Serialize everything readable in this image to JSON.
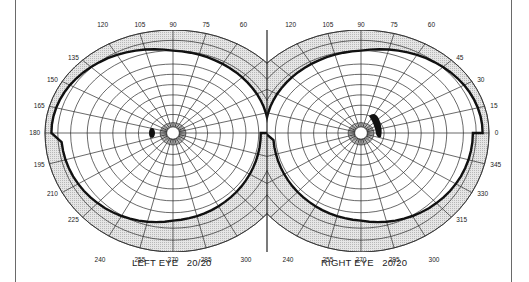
{
  "chart_data": {
    "type": "polar-visual-field",
    "title": "",
    "grid": true,
    "colors": {
      "background": "#ffffff",
      "grid": "#2a2a2a",
      "shade": "#d8d8d8",
      "isopter": "#111111",
      "frame": "#6a6a6a"
    },
    "charts": [
      {
        "id": "left",
        "label": "LEFT EYE",
        "acuity": "20/20",
        "center": [
          173,
          133
        ],
        "angle_labels_shown": [
          "120",
          "105",
          "90",
          "75",
          "60",
          "135",
          "150",
          "165",
          "180",
          "195",
          "210",
          "225",
          "240",
          "255",
          "270",
          "285",
          "300"
        ],
        "blind_spot": {
          "side": "temporal",
          "angle_deg": 180,
          "approx_eccentricity_deg": 15
        },
        "isopter": "thick boundary line; visual field extends wider temporally (left) than nasally"
      },
      {
        "id": "right",
        "label": "RIGHT EYE",
        "acuity": "20/20",
        "center": [
          361,
          133
        ],
        "angle_labels_shown": [
          "120",
          "105",
          "90",
          "75",
          "60",
          "45",
          "30",
          "15",
          "0",
          "345",
          "330",
          "315",
          "240",
          "255",
          "270",
          "285",
          "300"
        ],
        "blind_spot": {
          "side": "temporal",
          "angle_deg": 10,
          "approx_eccentricity_deg": 15,
          "note": "enlarged arcuate (crescent) scotoma extending superiorly"
        },
        "isopter": "thick boundary line; visual field extends wider temporally (right) than nasally"
      }
    ],
    "angle_step_deg": 15,
    "ring_count": 9
  },
  "labels": {
    "left_eye": "LEFT EYE   20/20",
    "right_eye": "RIGHT EYE   20/20"
  }
}
